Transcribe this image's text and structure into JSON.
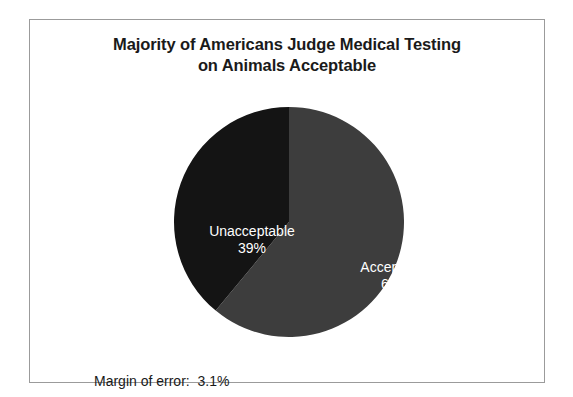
{
  "chart_data": {
    "type": "pie",
    "title": "Majority of Americans Judge Medical Testing on Animals Acceptable",
    "title_line_1": "Majority of Americans Judge Medical Testing",
    "title_line_2": "on Animals Acceptable",
    "xlabel": "",
    "ylabel": "",
    "legend_position": "none",
    "grid": false,
    "start_angle_deg": 0,
    "direction": "clockwise",
    "categories": [
      "Acceptable",
      "Unacceptable"
    ],
    "values": [
      61,
      39
    ],
    "units": "%",
    "slices": [
      {
        "label": "Acceptable",
        "value": 61,
        "value_label": "61%",
        "color": "#3d3d3d",
        "text_color": "#ffffff"
      },
      {
        "label": "Unacceptable",
        "value": 39,
        "value_label": "39%",
        "color": "#141414",
        "text_color": "#ffffff"
      }
    ],
    "annotations": [
      "Margin of error:  3.1%"
    ]
  },
  "footnote": {
    "margin_of_error": "Margin of error:  3.1%"
  },
  "colors": {
    "frame_border": "#9b9b9b",
    "background": "#ffffff",
    "title_text": "#1a1a1a",
    "acceptable_slice": "#3d3d3d",
    "unacceptable_slice": "#141414"
  }
}
